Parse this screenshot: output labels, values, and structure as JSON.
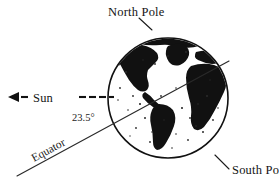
{
  "figure": {
    "type": "diagram",
    "width": 279,
    "height": 183,
    "background_color": "#ffffff",
    "ink_color": "#111111"
  },
  "labels": {
    "north_pole": "North Pole",
    "south_pole": "South Pole",
    "sun": "Sun",
    "equator": "Equator",
    "tilt_angle": "23.5°"
  },
  "globe": {
    "center_x": 168,
    "center_y": 98,
    "radius": 60,
    "landmasses": [
      "North America",
      "Greenland",
      "South America",
      "Europe",
      "Africa",
      "Antarctica"
    ]
  },
  "sun_ray": {
    "direction": "leftward",
    "arrow_label": "arrow pointing away from Earth toward the Sun",
    "dash_count": 6,
    "start_x": 108,
    "end_x": 8,
    "y": 97
  },
  "equator_line": {
    "from_x": 17,
    "from_y": 176,
    "to_x": 229,
    "to_y": 61,
    "angle_degrees": 23.5
  },
  "leaders": {
    "north_pole": {
      "from_x": 139,
      "from_y": 17,
      "to_x": 152,
      "to_y": 29
    },
    "south_pole": {
      "from_x": 228,
      "from_y": 168,
      "to_x": 215,
      "to_y": 155
    }
  }
}
